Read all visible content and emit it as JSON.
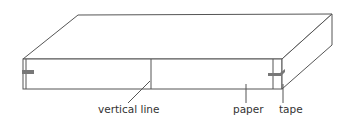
{
  "diagram": {
    "labels": {
      "vertical_line": "vertical line",
      "paper": "paper",
      "tape": "tape"
    },
    "colors": {
      "stroke": "#555555",
      "tape": "#777777",
      "text": "#333333"
    }
  }
}
